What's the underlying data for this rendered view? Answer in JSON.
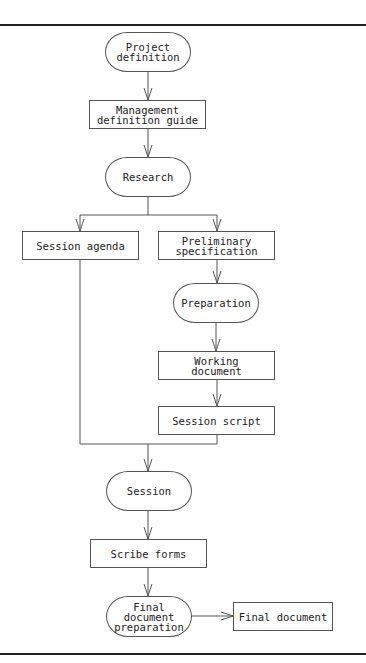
{
  "diagram": {
    "nodes": [
      {
        "id": "project-definition",
        "label": "Project\ndefinition",
        "shape": "terminal",
        "x": 105,
        "y": 32,
        "w": 86,
        "h": 40
      },
      {
        "id": "management-definition-guide",
        "label": "Management\ndefinition guide",
        "shape": "process",
        "x": 89,
        "y": 100,
        "w": 117,
        "h": 29
      },
      {
        "id": "research",
        "label": "Research",
        "shape": "terminal",
        "x": 105,
        "y": 157,
        "w": 86,
        "h": 40
      },
      {
        "id": "session-agenda",
        "label": "Session agenda",
        "shape": "process",
        "x": 22,
        "y": 231,
        "w": 117,
        "h": 29
      },
      {
        "id": "preliminary-specification",
        "label": "Preliminary\nspecification",
        "shape": "process",
        "x": 158,
        "y": 231,
        "w": 117,
        "h": 29
      },
      {
        "id": "preparation",
        "label": "Preparation",
        "shape": "terminal",
        "x": 173,
        "y": 283,
        "w": 86,
        "h": 40
      },
      {
        "id": "working-document",
        "label": "Working\ndocument",
        "shape": "process",
        "x": 158,
        "y": 351,
        "w": 117,
        "h": 29
      },
      {
        "id": "session-script",
        "label": "Session script",
        "shape": "process",
        "x": 158,
        "y": 406,
        "w": 117,
        "h": 29
      },
      {
        "id": "session",
        "label": "Session",
        "shape": "terminal",
        "x": 106,
        "y": 471,
        "w": 86,
        "h": 40
      },
      {
        "id": "scribe-forms",
        "label": "Scribe forms",
        "shape": "process",
        "x": 90,
        "y": 539,
        "w": 117,
        "h": 29
      },
      {
        "id": "final-document-preparation",
        "label": "Final\ndocument\npreparation",
        "shape": "terminal",
        "x": 106,
        "y": 596,
        "w": 86,
        "h": 41
      },
      {
        "id": "final-document",
        "label": "Final document",
        "shape": "process",
        "x": 233,
        "y": 602,
        "w": 100,
        "h": 29
      }
    ],
    "edges": [
      {
        "from": "project-definition",
        "to": "management-definition-guide"
      },
      {
        "from": "management-definition-guide",
        "to": "research"
      },
      {
        "from": "research",
        "to": "session-agenda"
      },
      {
        "from": "research",
        "to": "preliminary-specification"
      },
      {
        "from": "preliminary-specification",
        "to": "preparation"
      },
      {
        "from": "preparation",
        "to": "working-document"
      },
      {
        "from": "working-document",
        "to": "session-script"
      },
      {
        "from": "session-agenda",
        "to": "session"
      },
      {
        "from": "session-script",
        "to": "session"
      },
      {
        "from": "session",
        "to": "scribe-forms"
      },
      {
        "from": "scribe-forms",
        "to": "final-document-preparation"
      },
      {
        "from": "final-document-preparation",
        "to": "final-document"
      }
    ],
    "colors": {
      "line": "#555555",
      "rule": "#222222",
      "text": "#222222"
    }
  }
}
